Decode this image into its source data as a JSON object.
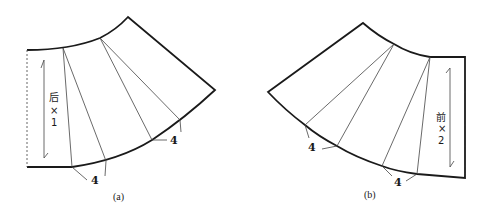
{
  "figure": {
    "panels": [
      {
        "id": "a",
        "caption": "(a)",
        "grain_label": {
          "char": "后",
          "times": "×",
          "count": "1"
        },
        "pleat_labels": [
          "4",
          "4"
        ]
      },
      {
        "id": "b",
        "caption": "(b)",
        "grain_label": {
          "char": "前",
          "times": "×",
          "count": "2"
        },
        "pleat_labels": [
          "4",
          "4"
        ]
      }
    ]
  }
}
